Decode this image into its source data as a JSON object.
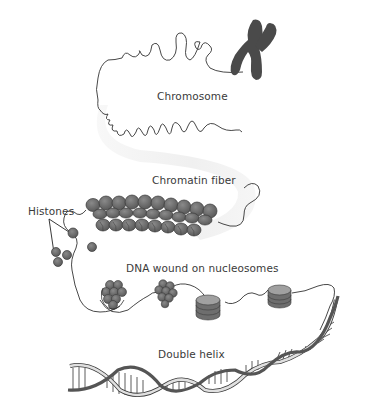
{
  "diagram": {
    "type": "biological-illustration",
    "labels": {
      "chromosome": "Chromosome",
      "chromatin_fiber": "Chromatin fiber",
      "histones": "Histones",
      "nucleosomes": "DNA wound on nucleosomes",
      "double_helix": "Double helix"
    },
    "stages": [
      {
        "name": "chromosome",
        "label": "Chromosome",
        "icon": "chromosome-x-shape"
      },
      {
        "name": "chromatin-fiber",
        "label": "Chromatin fiber",
        "icon": "coiled-fiber"
      },
      {
        "name": "nucleosomes",
        "label": "DNA wound on nucleosomes",
        "icon": "histone-spools"
      },
      {
        "name": "double-helix",
        "label": "Double helix",
        "icon": "dna-helix"
      }
    ],
    "colors": {
      "line": "#333333",
      "chromosome_fill": "#4a4a4a",
      "bead_fill": "#707070",
      "bead_stroke": "#3a3a3a",
      "background_band": "#ececec",
      "helix_dark": "#555555",
      "helix_light": "#d8d8d8"
    }
  }
}
